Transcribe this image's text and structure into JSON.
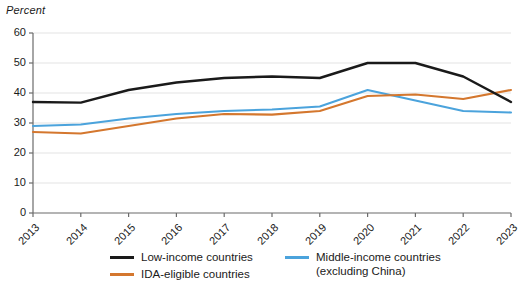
{
  "chart_data": {
    "type": "line",
    "title": "",
    "ylabel": "Percent",
    "xlabel": "",
    "ylim": [
      0,
      60
    ],
    "yticks": [
      0,
      10,
      20,
      30,
      40,
      50,
      60
    ],
    "grid": true,
    "legend_position": "bottom",
    "categories": [
      "2013",
      "2014",
      "2015",
      "2016",
      "2017",
      "2018",
      "2019",
      "2020",
      "2021",
      "2022",
      "2023"
    ],
    "series": [
      {
        "name": "Low-income countries",
        "color": "#1a1a1a",
        "values": [
          37,
          36.8,
          41,
          43.5,
          45,
          45.5,
          45,
          50,
          50,
          45.5,
          37
        ]
      },
      {
        "name": "Middle-income countries (excluding China)",
        "color": "#4BA3DC",
        "values": [
          29,
          29.5,
          31.5,
          33,
          34,
          34.5,
          35.5,
          41,
          37.5,
          34,
          33.5
        ]
      },
      {
        "name": "IDA-eligible countries",
        "color": "#D4772E",
        "values": [
          27,
          26.5,
          29,
          31.5,
          33,
          32.8,
          34,
          39,
          39.5,
          38,
          41
        ]
      }
    ]
  },
  "legend": {
    "entries": [
      {
        "label": "Low-income countries",
        "color": "#1a1a1a"
      },
      {
        "label": "Middle-income countries",
        "label2": "(excluding China)",
        "color": "#4BA3DC"
      },
      {
        "label": "IDA-eligible countries",
        "color": "#D4772E"
      }
    ]
  },
  "axes": {
    "y_title": "Percent",
    "y_ticks": [
      "60",
      "50",
      "40",
      "30",
      "20",
      "10",
      "0"
    ],
    "x_ticks": [
      "2013",
      "2014",
      "2015",
      "2016",
      "2017",
      "2018",
      "2019",
      "2020",
      "2021",
      "2022",
      "2023"
    ]
  },
  "colors": {
    "low_income": "#1a1a1a",
    "middle_income": "#4BA3DC",
    "ida_eligible": "#D4772E",
    "gridline": "#e3e3e3",
    "axis": "#6b6b6b"
  }
}
